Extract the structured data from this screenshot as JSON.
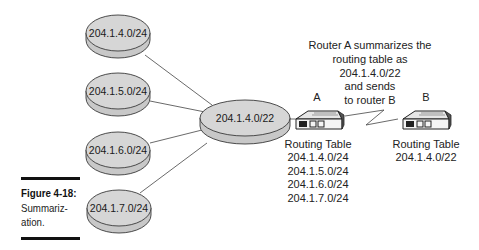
{
  "networks": [
    {
      "id": "net1",
      "label": "204.1.4.0/24"
    },
    {
      "id": "net2",
      "label": "204.1.5.0/24"
    },
    {
      "id": "net3",
      "label": "204.1.6.0/24"
    },
    {
      "id": "net4",
      "label": "204.1.7.0/24"
    }
  ],
  "summary_network": {
    "label": "204.1.4.0/22"
  },
  "router_a": {
    "label": "A",
    "table_title": "Routing Table",
    "routes": [
      "204.1.4.0/24",
      "204.1.5.0/24",
      "204.1.6.0/24",
      "204.1.7.0/24"
    ]
  },
  "router_b": {
    "label": "B",
    "table_title": "Routing Table",
    "routes": [
      "204.1.4.0/22"
    ]
  },
  "annotation": {
    "lines": [
      "Router A summarizes the",
      "routing table as",
      "204.1.4.0/22",
      "and sends",
      "to router B"
    ]
  },
  "caption": {
    "title": "Figure 4-18:",
    "text": "Summariz-\nation."
  }
}
